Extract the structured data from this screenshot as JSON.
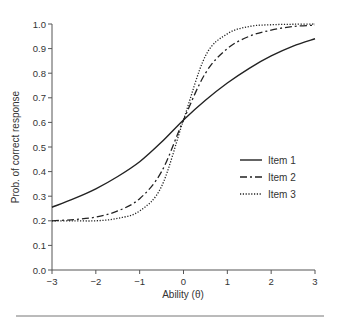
{
  "chart_data": {
    "type": "line",
    "title": "",
    "xlabel": "Ability (θ)",
    "ylabel": "Prob. of correct response",
    "xlim": [
      -3,
      3
    ],
    "ylim": [
      0.0,
      1.0
    ],
    "grid": false,
    "legend_position": "right-center",
    "x_ticks": [
      "−3",
      "−2",
      "−1",
      "0",
      "1",
      "2",
      "3"
    ],
    "x_tick_values": [
      -3,
      -2,
      -1,
      0,
      1,
      2,
      3
    ],
    "y_ticks": [
      "0.0",
      "0.1",
      "0.2",
      "0.3",
      "0.4",
      "0.5",
      "0.6",
      "0.7",
      "0.8",
      "0.9",
      "1.0"
    ],
    "y_tick_values": [
      0.0,
      0.1,
      0.2,
      0.3,
      0.4,
      0.5,
      0.6,
      0.7,
      0.8,
      0.9,
      1.0
    ],
    "x": [
      -3,
      -2.5,
      -2,
      -1.5,
      -1,
      -0.5,
      0,
      0.5,
      1,
      1.5,
      2,
      2.5,
      3
    ],
    "series": [
      {
        "name": "Item 1",
        "style": "solid",
        "values": [
          0.255,
          0.29,
          0.33,
          0.38,
          0.44,
          0.52,
          0.61,
          0.69,
          0.76,
          0.82,
          0.87,
          0.91,
          0.94
        ]
      },
      {
        "name": "Item 2",
        "style": "dashdot",
        "values": [
          0.2,
          0.205,
          0.215,
          0.24,
          0.29,
          0.4,
          0.61,
          0.8,
          0.9,
          0.95,
          0.975,
          0.99,
          0.995
        ]
      },
      {
        "name": "Item 3",
        "style": "dotted",
        "values": [
          0.2,
          0.2,
          0.2,
          0.21,
          0.24,
          0.34,
          0.61,
          0.87,
          0.96,
          0.99,
          0.997,
          0.999,
          1.0
        ]
      }
    ]
  },
  "legend": {
    "items": [
      {
        "label": "Item 1",
        "style": "solid"
      },
      {
        "label": "Item 2",
        "style": "dashdot"
      },
      {
        "label": "Item 3",
        "style": "dotted"
      }
    ]
  }
}
